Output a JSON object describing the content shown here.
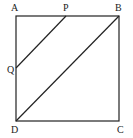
{
  "diagram": {
    "type": "geometry",
    "shape": "square",
    "points": {
      "A": {
        "label": "A",
        "x": 16,
        "y": 16
      },
      "B": {
        "label": "B",
        "x": 119,
        "y": 16
      },
      "C": {
        "label": "C",
        "x": 119,
        "y": 121
      },
      "D": {
        "label": "D",
        "x": 16,
        "y": 121
      },
      "P": {
        "label": "P",
        "x": 66,
        "y": 16
      },
      "Q": {
        "label": "Q",
        "x": 16,
        "y": 68
      }
    },
    "segments": [
      [
        "A",
        "B"
      ],
      [
        "B",
        "C"
      ],
      [
        "C",
        "D"
      ],
      [
        "D",
        "A"
      ],
      [
        "P",
        "Q"
      ],
      [
        "B",
        "D"
      ]
    ],
    "line_color": "#222222"
  }
}
